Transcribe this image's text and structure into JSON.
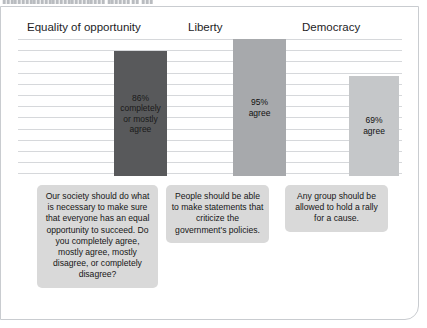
{
  "top_sliver": {
    "text": "▮▮▮▮▮▮▮▮▮▮▮▮▮▮▮▮▮▮▮▮▮▮▮▮▮▮▮ ▮▮▮▮▮▮ ▮▮ ▮▮▮"
  },
  "colors": {
    "bar_dark": "#58595b",
    "bar_mid": "#a7a9ac",
    "bar_light": "#c5c7c9",
    "gridline": "#d6d8db",
    "caption_bg": "#d9d9d9",
    "card_border": "#c9ccd0",
    "text": "#1d1d1f"
  },
  "chart_data": {
    "type": "bar",
    "title": "",
    "xlabel": "",
    "ylabel": "",
    "ylim": [
      0,
      100
    ],
    "grid": true,
    "legend": "none",
    "categories": [
      "Equality of opportunity",
      "Liberty",
      "Democracy"
    ],
    "values": [
      86,
      95,
      69
    ],
    "bar_labels": [
      "86%\ncompletely\nor mostly\nagree",
      "95%\nagree",
      "69%\nagree"
    ],
    "bar_colors": [
      "#58595b",
      "#a7a9ac",
      "#c5c7c9"
    ],
    "annotations": [
      "Our society should do what is necessary to make sure that everyone has an equal opportunity to succeed. Do you completely agree, mostly agree, mostly disagree, or completely disagree?",
      "People should be able to make statements that criticize the government's policies.",
      "Any group should be allowed to hold a rally for a cause."
    ]
  }
}
